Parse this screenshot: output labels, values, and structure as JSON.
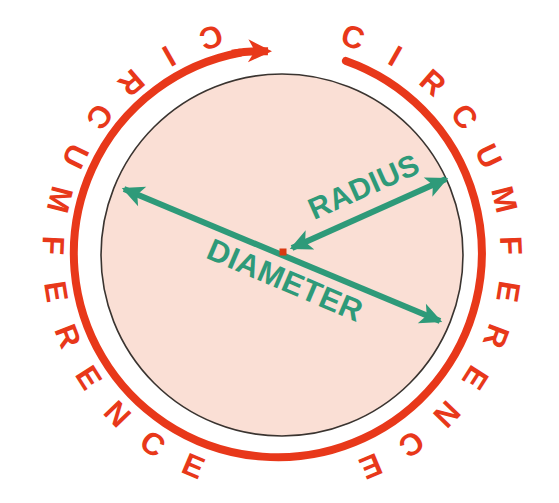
{
  "diagram": {
    "type": "geometry-diagram",
    "canvas": {
      "width": 559,
      "height": 503
    },
    "background_color": "#ffffff",
    "circle": {
      "name": "circle-shape",
      "center_x": 282,
      "center_y": 255,
      "radius": 181,
      "fill_color": "#fadfd5",
      "stroke_color": "#3a3430",
      "stroke_width": 1.6
    },
    "center_dot": {
      "name": "center-point",
      "x": 283,
      "y": 252,
      "size": 6,
      "color": "#d93a12"
    },
    "circumference_arc": {
      "name": "circumference-arc",
      "color": "#e8381a",
      "stroke_width": 8,
      "radius": 204,
      "arrow_label": "clockwise-direction-arrow",
      "gap_description": "arc is broken at the top where the arrowhead points clockwise"
    },
    "labels": {
      "circumference_left": "CIRCUMFERENCE",
      "circumference_right": "CIRCUMFERENCE",
      "radius": "RADIUS",
      "diameter": "DIAMETER"
    },
    "label_colors": {
      "circumference": "#e8381a",
      "radius": "#2e9a79",
      "diameter": "#2e9a79"
    },
    "radius_arrow": {
      "name": "radius-arrow",
      "from_x": 283,
      "from_y": 252,
      "to_x": 452,
      "to_y": 176,
      "color": "#2e9a79",
      "stroke_width": 6,
      "double_headed": true
    },
    "diameter_arrow": {
      "name": "diameter-arrow",
      "from_x": 118,
      "from_y": 186,
      "to_x": 446,
      "to_y": 324,
      "color": "#2e9a79",
      "stroke_width": 6,
      "double_headed": true
    },
    "letters_left": [
      "C",
      "I",
      "R",
      "C",
      "U",
      "M",
      "F",
      "E",
      "R",
      "E",
      "N",
      "C",
      "E"
    ],
    "letters_right": [
      "C",
      "I",
      "R",
      "C",
      "U",
      "M",
      "F",
      "E",
      "R",
      "E",
      "N",
      "C",
      "E"
    ]
  }
}
